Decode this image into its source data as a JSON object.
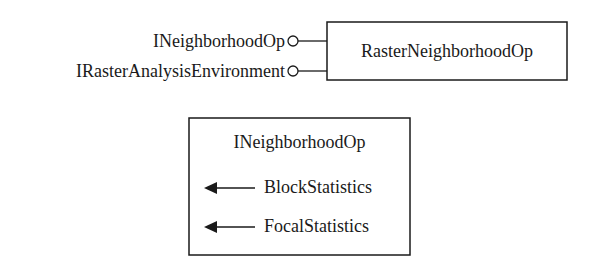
{
  "diagram": {
    "class_box": {
      "title": "RasterNeighborhoodOp",
      "interfaces": [
        "INeighborhoodOp",
        "IRasterAnalysisEnvironment"
      ]
    },
    "interface_box": {
      "title": "INeighborhoodOp",
      "methods": [
        "BlockStatistics",
        "FocalStatistics"
      ]
    },
    "colors": {
      "stroke": "#1a1a1a",
      "background": "#ffffff"
    }
  }
}
